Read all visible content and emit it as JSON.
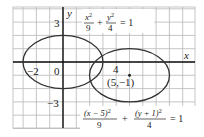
{
  "figure": {
    "type": "coordinate-plane-ellipses",
    "axes": {
      "x_label": "x",
      "y_label": "y",
      "tick_labels": {
        "y_pos": "3",
        "y_neg": "−3",
        "x_neg": "−2",
        "origin": "0",
        "x_pos": "4"
      }
    },
    "ellipses": [
      {
        "name": "ellipse-1",
        "center": [
          0,
          0
        ],
        "a": 3,
        "b": 2,
        "equation": {
          "t1_num": "x",
          "t1_exp": "2",
          "t1_den": "9",
          "plus": "+",
          "t2_num": "y",
          "t2_exp": "2",
          "t2_den": "4",
          "eq": "= 1"
        }
      },
      {
        "name": "ellipse-2",
        "center": [
          5,
          -1
        ],
        "a": 3,
        "b": 2,
        "center_label": "(5,−1)",
        "equation": {
          "t1_num": "(x − 5)",
          "t1_exp": "2",
          "t1_den": "9",
          "plus": "+",
          "t2_num": "(y + 1)",
          "t2_exp": "2",
          "t2_den": "4",
          "eq": "= 1"
        }
      }
    ],
    "colors": {
      "grid": "#b8b8b8",
      "axis": "#111111",
      "curve": "#333333",
      "text": "#222222"
    }
  }
}
